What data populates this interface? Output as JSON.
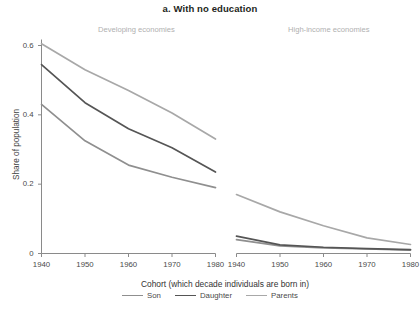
{
  "figure": {
    "title": "a. With no education",
    "panels": [
      {
        "name": "developing",
        "label": "Developing economies"
      },
      {
        "name": "high-income",
        "label": "High-income economies"
      }
    ],
    "axis": {
      "ylabel": "Share of population",
      "xlabel": "Cohort (which decade individuals are born in)",
      "yticks": [
        "0",
        "0.2",
        "0.4",
        "0.6"
      ],
      "xticks": [
        "1940",
        "1950",
        "1960",
        "1970",
        "1980"
      ]
    },
    "legend": [
      {
        "label": "Son",
        "color": "#8f8f8f"
      },
      {
        "label": "Daughter",
        "color": "#555555"
      },
      {
        "label": "Parents",
        "color": "#a8a8a8"
      }
    ]
  },
  "chart_data": {
    "type": "line",
    "title": "a. With no education",
    "xlabel": "Cohort (which decade individuals are born in)",
    "ylabel": "Share of population",
    "x": [
      1940,
      1950,
      1960,
      1970,
      1980
    ],
    "xlim": [
      1940,
      1980
    ],
    "ylim": [
      0,
      0.63
    ],
    "yticks": [
      0,
      0.2,
      0.4,
      0.6
    ],
    "grid": false,
    "legend_position": "bottom-center",
    "panels": [
      {
        "name": "Developing economies",
        "series": [
          {
            "name": "Son",
            "color": "#8f8f8f",
            "values": [
              0.43,
              0.325,
              0.255,
              0.22,
              0.19
            ]
          },
          {
            "name": "Daughter",
            "color": "#555555",
            "values": [
              0.545,
              0.435,
              0.36,
              0.305,
              0.235
            ]
          },
          {
            "name": "Parents",
            "color": "#a8a8a8",
            "values": [
              0.605,
              0.53,
              0.47,
              0.405,
              0.33
            ]
          }
        ]
      },
      {
        "name": "High-income economies",
        "series": [
          {
            "name": "Son",
            "color": "#8f8f8f",
            "values": [
              0.04,
              0.022,
              0.016,
              0.013,
              0.01
            ]
          },
          {
            "name": "Daughter",
            "color": "#555555",
            "values": [
              0.05,
              0.025,
              0.018,
              0.014,
              0.011
            ]
          },
          {
            "name": "Parents",
            "color": "#a8a8a8",
            "values": [
              0.17,
              0.12,
              0.08,
              0.045,
              0.026
            ]
          }
        ]
      }
    ]
  }
}
